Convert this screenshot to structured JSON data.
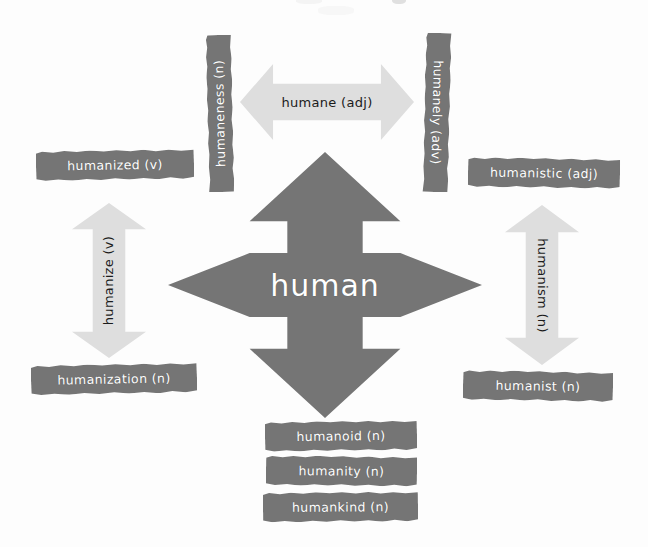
{
  "diagram": {
    "title_text": "human",
    "type": "word-family-mind-map",
    "root": {
      "label": "human",
      "part_of_speech": "",
      "shape": "four-way-arrow"
    },
    "colors": {
      "background": "#fdfdfd",
      "chip_fill": "#757575",
      "chip_text": "#ffffff",
      "arrow_fill": "#dedede",
      "arrow_text": "#1b1b1b",
      "center_fill": "#757575",
      "center_text": "#ffffff"
    },
    "branches": {
      "top": {
        "connector_label": "humane (adj)",
        "connector_direction": "horizontal-double",
        "left_chip": "humaneness (n)",
        "right_chip": "humanely (adv)"
      },
      "left": {
        "connector_label": "humanize (v)",
        "connector_direction": "vertical-double",
        "top_chip": "humanized (v)",
        "bottom_chip": "humanization (n)"
      },
      "right": {
        "connector_label": "humanism (n)",
        "connector_direction": "vertical-double",
        "top_chip": "humanistic (adj)",
        "bottom_chip": "humanist (n)"
      },
      "bottom": {
        "connector_label": "",
        "connector_direction": "down",
        "chips": [
          "humanoid (n)",
          "humanity (n)",
          "humankind (n)"
        ]
      }
    },
    "all_words": [
      "human",
      "humane (adj)",
      "humaneness (n)",
      "humanely (adv)",
      "humanized (v)",
      "humanize (v)",
      "humanization (n)",
      "humanistic (adj)",
      "humanism (n)",
      "humanist (n)",
      "humanoid (n)",
      "humanity (n)",
      "humankind (n)"
    ]
  }
}
